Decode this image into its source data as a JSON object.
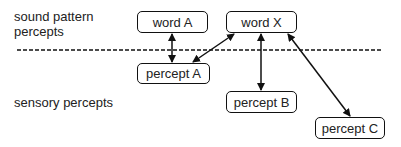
{
  "layers": {
    "upper_label_line1": "sound pattern",
    "upper_label_line2": "percepts",
    "lower_label": "sensory percepts"
  },
  "nodes": [
    {
      "id": "wordA",
      "label": "word A",
      "layer": "sound pattern percepts"
    },
    {
      "id": "wordX",
      "label": "word X",
      "layer": "sound pattern percepts"
    },
    {
      "id": "perceptA",
      "label": "percept A",
      "layer": "sensory percepts"
    },
    {
      "id": "perceptB",
      "label": "percept B",
      "layer": "sensory percepts"
    },
    {
      "id": "perceptC",
      "label": "percept C",
      "layer": "sensory percepts"
    }
  ],
  "edges": [
    {
      "from": "wordA",
      "to": "perceptA",
      "direction": "bidirectional"
    },
    {
      "from": "wordX",
      "to": "perceptA",
      "direction": "bidirectional"
    },
    {
      "from": "wordX",
      "to": "perceptB",
      "direction": "bidirectional"
    },
    {
      "from": "wordX",
      "to": "perceptC",
      "direction": "bidirectional"
    }
  ],
  "divider": {
    "style": "dashed",
    "color": "#111111"
  }
}
